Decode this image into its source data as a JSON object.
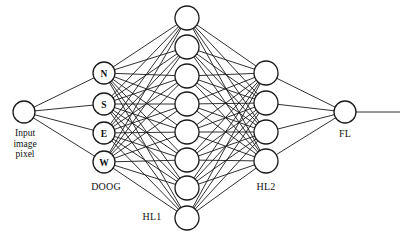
{
  "figure": {
    "background_color": "#ffffff",
    "line_color": "#1a1a1a",
    "node_fill": "#ffffff"
  },
  "layers": {
    "input": {
      "name": "input",
      "caption": "Input\nimage\npixel",
      "caption_lines": [
        "Input",
        "image",
        "pixel"
      ],
      "node_count": 1,
      "radius": 11,
      "x": 24,
      "nodes": [
        {
          "label": "",
          "cx": 24,
          "cy": 112
        }
      ]
    },
    "doog": {
      "name": "doog",
      "label": "DOOG",
      "label_x": 106,
      "label_y": 186,
      "node_count": 4,
      "radius": 11,
      "x": 104,
      "nodes": [
        {
          "label": "N",
          "cx": 104,
          "cy": 73
        },
        {
          "label": "S",
          "cx": 104,
          "cy": 104
        },
        {
          "label": "E",
          "cx": 104,
          "cy": 133
        },
        {
          "label": "W",
          "cx": 104,
          "cy": 162
        }
      ]
    },
    "hl1": {
      "name": "hl1",
      "label": "HL1",
      "label_x": 152,
      "label_y": 216,
      "node_count": 8,
      "radius": 12,
      "x": 187,
      "nodes": [
        {
          "label": "",
          "cx": 187,
          "cy": 18
        },
        {
          "label": "",
          "cx": 187,
          "cy": 47
        },
        {
          "label": "",
          "cx": 187,
          "cy": 76
        },
        {
          "label": "",
          "cx": 187,
          "cy": 104
        },
        {
          "label": "",
          "cx": 187,
          "cy": 132
        },
        {
          "label": "",
          "cx": 187,
          "cy": 160
        },
        {
          "label": "",
          "cx": 187,
          "cy": 188
        },
        {
          "label": "",
          "cx": 187,
          "cy": 218
        }
      ]
    },
    "hl2": {
      "name": "hl2",
      "label": "HL2",
      "label_x": 266,
      "label_y": 186,
      "node_count": 4,
      "radius": 12,
      "x": 266,
      "nodes": [
        {
          "label": "",
          "cx": 266,
          "cy": 73
        },
        {
          "label": "",
          "cx": 266,
          "cy": 103
        },
        {
          "label": "",
          "cx": 266,
          "cy": 132
        },
        {
          "label": "",
          "cx": 266,
          "cy": 161
        }
      ]
    },
    "fl": {
      "name": "fl",
      "label": "FL",
      "label_x": 345,
      "label_y": 133,
      "node_count": 1,
      "radius": 11,
      "x": 345,
      "nodes": [
        {
          "label": "",
          "cx": 345,
          "cy": 112
        }
      ],
      "output_line": {
        "x1": 356,
        "y1": 112,
        "x2": 400,
        "y2": 112
      }
    }
  },
  "connections": [
    {
      "from": "input",
      "to": "doog",
      "style": "fully-connected",
      "count": 4
    },
    {
      "from": "doog",
      "to": "hl1",
      "style": "fully-connected",
      "count": 32
    },
    {
      "from": "hl1",
      "to": "hl2",
      "style": "fully-connected",
      "count": 32
    },
    {
      "from": "hl2",
      "to": "fl",
      "style": "fully-connected",
      "count": 4
    }
  ]
}
